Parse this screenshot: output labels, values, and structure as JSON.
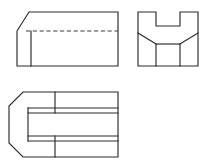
{
  "sheet": {
    "title": "Orthographic Multiview Engineering Drawing",
    "background_color": "#ffffff",
    "width": 206,
    "height": 165,
    "line_color": "#2b2b2b",
    "hidden_line_color": "#3a3a3a",
    "projection": "third-angle orthographic projection",
    "views_count": 3
  },
  "views": [
    {
      "id": "front-view",
      "label": "Front View",
      "position": "top-left",
      "bounds": {
        "x": 17,
        "y": 12,
        "width": 101,
        "height": 54
      },
      "outline_points": "17,31 29,12 118,12 118,66 17,66",
      "features": [
        {
          "id": "front-chamfer-edge",
          "name": "chamfer-slope",
          "type": "visible-line",
          "points": "17,31 29,12"
        },
        {
          "id": "front-vertical-edge",
          "name": "chamfer-termination-edge",
          "type": "visible-line",
          "points": "31,31 31,66"
        },
        {
          "id": "front-hidden-line",
          "name": "hidden-slot-edge",
          "type": "hidden-line",
          "points": "26,31 118,31"
        }
      ]
    },
    {
      "id": "side-view",
      "label": "Right Side View",
      "position": "top-right",
      "bounds": {
        "x": 138,
        "y": 12,
        "width": 60,
        "height": 54
      },
      "outline_points": "138,12 156,12 156,26 180,26 180,12 198,12 198,66 138,66",
      "features": [
        {
          "id": "side-u-notch",
          "name": "u-shaped-notch",
          "type": "visible-outline",
          "points": "156,12 156,26 180,26 180,12"
        },
        {
          "id": "side-left-chamfer",
          "name": "left-chamfer-line",
          "type": "visible-line",
          "points": "138,33 156,44"
        },
        {
          "id": "side-right-chamfer",
          "name": "right-chamfer-line",
          "type": "visible-line",
          "points": "198,33 180,44"
        },
        {
          "id": "side-base-top",
          "name": "base-top-edge",
          "type": "visible-line",
          "points": "156,44 180,44"
        },
        {
          "id": "side-left-vertical",
          "name": "base-left-vertical-edge",
          "type": "visible-line",
          "points": "156,44 156,66"
        },
        {
          "id": "side-right-vertical",
          "name": "base-right-vertical-edge",
          "type": "visible-line",
          "points": "180,44 180,66"
        }
      ]
    },
    {
      "id": "top-view",
      "label": "Top View",
      "position": "bottom-left",
      "bounds": {
        "x": 9,
        "y": 92,
        "width": 109,
        "height": 65
      },
      "outline_points": "23,92 118,92 118,157 23,157 9,143 9,106",
      "features": [
        {
          "id": "top-upper-rib-line",
          "name": "upper-rib-edge",
          "type": "visible-line",
          "points": "28,113 118,113"
        },
        {
          "id": "top-lower-rib-line",
          "name": "lower-rib-edge",
          "type": "visible-line",
          "points": "28,136 118,136"
        },
        {
          "id": "top-slot-outline",
          "name": "internal-slot",
          "type": "visible-outline",
          "points": "28,108 118,108 118,141 28,141"
        },
        {
          "id": "top-slot-left-end",
          "name": "slot-left-end-edge",
          "type": "visible-line",
          "points": "28,108 28,141"
        },
        {
          "id": "top-divider-upper",
          "name": "upper-divider-line",
          "type": "visible-line",
          "points": "55,92 55,113"
        },
        {
          "id": "top-divider-lower",
          "name": "lower-divider-line",
          "type": "visible-line",
          "points": "55,136 55,157"
        },
        {
          "id": "top-left-chamfer-upper",
          "name": "upper-left-chamfer",
          "type": "visible-line",
          "points": "23,92 9,106"
        },
        {
          "id": "top-left-chamfer-lower",
          "name": "lower-left-chamfer",
          "type": "visible-line",
          "points": "9,143 23,157"
        }
      ]
    }
  ]
}
